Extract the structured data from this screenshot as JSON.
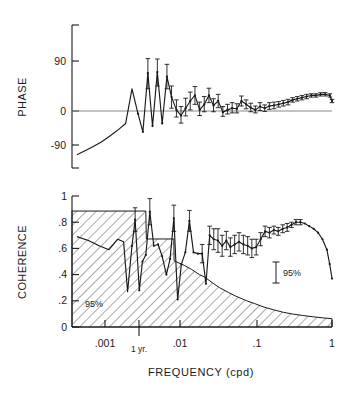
{
  "figure": {
    "name": "phase-and-coherence-spectrum",
    "background": "#ffffff",
    "ink": "#1a1a1a"
  },
  "panels": {
    "phase": {
      "ylabel": "PHASE",
      "yticks": [
        "90",
        "0",
        "-90"
      ],
      "ylim": [
        -180,
        180
      ],
      "zero_line": true
    },
    "coherence": {
      "ylabel": "COHERENCE",
      "yticks": [
        "1",
        ".8",
        ".6",
        ".4",
        ".2",
        "0"
      ],
      "ylim": [
        0,
        1
      ],
      "significance_label_left": "95%",
      "significance_label_right": "95%"
    }
  },
  "xaxis": {
    "label": "FREQUENCY  (cpd)",
    "ticks": [
      ".001",
      "1 yr.",
      ".01",
      ".1",
      "1"
    ],
    "lim": [
      0.0003,
      1.0
    ],
    "scale": "log"
  },
  "chart_data": [
    {
      "type": "line",
      "title": "PHASE",
      "xlabel": "FREQUENCY (cpd)",
      "ylabel": "PHASE",
      "ylim": [
        -180,
        180
      ],
      "xlim": [
        0.0003,
        1.0
      ],
      "xscale": "log",
      "grid": false,
      "legend": "none",
      "annotations": [
        "zero reference line at phase = 0"
      ],
      "x": [
        0.00035,
        0.00055,
        0.00075,
        0.001,
        0.0013,
        0.0016,
        0.00195,
        0.00235,
        0.00274,
        0.0032,
        0.0037,
        0.0043,
        0.005,
        0.0058,
        0.0067,
        0.0078,
        0.009,
        0.0104,
        0.012,
        0.0139,
        0.0161,
        0.0186,
        0.0215,
        0.0248,
        0.0287,
        0.0332,
        0.0384,
        0.0444,
        0.0513,
        0.0593,
        0.0686,
        0.0793,
        0.0917,
        0.106,
        0.1226,
        0.1418,
        0.1639,
        0.1895,
        0.2191,
        0.2533,
        0.2929,
        0.3387,
        0.3915,
        0.4527,
        0.5234,
        0.6052,
        0.6998,
        0.8091,
        0.9355,
        1.0
      ],
      "y": [
        -128,
        -100,
        -82,
        -65,
        -48,
        -33,
        40,
        -7,
        -55,
        68,
        -40,
        70,
        -33,
        62,
        25,
        2,
        -12,
        5,
        18,
        28,
        2,
        12,
        28,
        10,
        18,
        -3,
        2,
        5,
        4,
        18,
        12,
        6,
        2,
        8,
        5,
        9,
        10,
        12,
        14,
        16,
        20,
        22,
        24,
        26,
        28,
        28,
        30,
        30,
        28,
        18
      ],
      "yerr": [
        0,
        0,
        0,
        0,
        0,
        0,
        0,
        0,
        0,
        28,
        0,
        25,
        0,
        22,
        20,
        18,
        20,
        18,
        16,
        16,
        14,
        14,
        13,
        12,
        12,
        11,
        10,
        10,
        9,
        9,
        8,
        8,
        7,
        7,
        6,
        6,
        6,
        5,
        5,
        5,
        4,
        4,
        4,
        4,
        3,
        3,
        3,
        3,
        3,
        3
      ]
    },
    {
      "type": "line",
      "title": "COHERENCE",
      "xlabel": "FREQUENCY (cpd)",
      "ylabel": "COHERENCE",
      "ylim": [
        0,
        1
      ],
      "xlim": [
        0.0003,
        1.0
      ],
      "xscale": "log",
      "grid": false,
      "legend": "none",
      "annotations": [
        "95% significance level (hatched region below)",
        "95% confidence interval bar at right"
      ],
      "x": [
        0.00035,
        0.0005,
        0.0007,
        0.00095,
        0.00125,
        0.0015,
        0.0017,
        0.00195,
        0.00215,
        0.00245,
        0.0027,
        0.003,
        0.0034,
        0.00385,
        0.0044,
        0.005,
        0.0057,
        0.0064,
        0.0072,
        0.0081,
        0.0091,
        0.0103,
        0.0117,
        0.0133,
        0.0152,
        0.0174,
        0.0196,
        0.022,
        0.025,
        0.0285,
        0.0325,
        0.037,
        0.042,
        0.048,
        0.055,
        0.063,
        0.072,
        0.082,
        0.094,
        0.108,
        0.124,
        0.142,
        0.163,
        0.187,
        0.215,
        0.247,
        0.283,
        0.325,
        0.373,
        0.428,
        0.491,
        0.564,
        0.647,
        0.743,
        0.853,
        0.93,
        1.0
      ],
      "y": [
        0.69,
        0.66,
        0.62,
        0.59,
        0.67,
        0.65,
        0.27,
        0.62,
        0.82,
        0.28,
        0.5,
        0.55,
        0.88,
        0.62,
        0.63,
        0.54,
        0.4,
        0.52,
        0.83,
        0.21,
        0.48,
        0.57,
        0.81,
        0.57,
        0.56,
        0.56,
        0.33,
        0.7,
        0.67,
        0.66,
        0.62,
        0.66,
        0.61,
        0.63,
        0.65,
        0.63,
        0.62,
        0.6,
        0.61,
        0.67,
        0.73,
        0.72,
        0.74,
        0.73,
        0.75,
        0.76,
        0.78,
        0.8,
        0.8,
        0.79,
        0.77,
        0.75,
        0.72,
        0.67,
        0.59,
        0.48,
        0.37
      ],
      "yerr": [
        0,
        0,
        0,
        0,
        0,
        0,
        0,
        0,
        0.09,
        0,
        0,
        0,
        0.1,
        0,
        0,
        0,
        0,
        0,
        0.1,
        0,
        0,
        0,
        0.08,
        0,
        0,
        0.07,
        0,
        0.07,
        0.08,
        0.09,
        0.08,
        0.07,
        0.07,
        0.07,
        0.07,
        0.07,
        0.07,
        0.07,
        0.06,
        0.05,
        0.04,
        0.04,
        0.03,
        0.03,
        0.03,
        0.03,
        0.02,
        0.02,
        0.02,
        0,
        0,
        0,
        0,
        0,
        0,
        0,
        0
      ],
      "significance_curve": {
        "name": "95% significance level",
        "x": [
          0.0003,
          0.003,
          0.00305,
          0.0072,
          0.00725,
          0.01,
          0.0125,
          0.016,
          0.019,
          0.02,
          0.025,
          0.03,
          0.04,
          0.05,
          0.07,
          0.09,
          0.12,
          0.16,
          0.22,
          0.3,
          0.4,
          0.55,
          0.75,
          1.0
        ],
        "y": [
          0.885,
          0.885,
          0.672,
          0.672,
          0.505,
          0.47,
          0.44,
          0.4,
          0.38,
          0.37,
          0.33,
          0.3,
          0.262,
          0.235,
          0.2,
          0.178,
          0.152,
          0.132,
          0.112,
          0.098,
          0.088,
          0.078,
          0.07,
          0.063
        ]
      }
    }
  ]
}
